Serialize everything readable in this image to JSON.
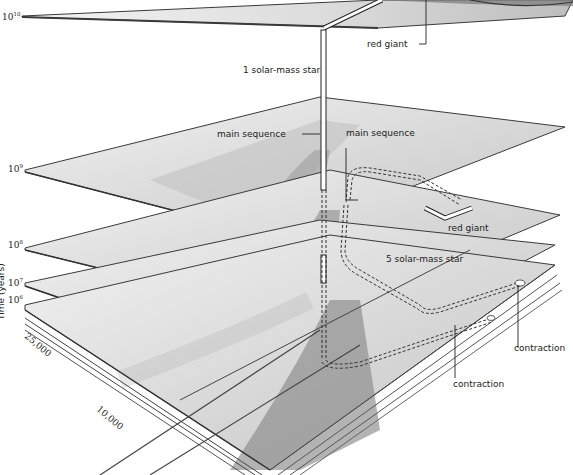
{
  "diagram": {
    "type": "3d-stacked-time-planes",
    "axis": {
      "vertical_label": "Time (years)",
      "time_ticks": [
        {
          "label": "10",
          "exp": "10"
        },
        {
          "label": "10",
          "exp": "9"
        },
        {
          "label": "10",
          "exp": "8"
        },
        {
          "label": "10",
          "exp": "7"
        },
        {
          "label": "10",
          "exp": "6"
        }
      ],
      "temperature_ticks": [
        "25,000",
        "10,000"
      ]
    },
    "labels": {
      "red_giant_top": "red giant",
      "one_solar_mass": "1 solar-mass star",
      "main_sequence_left": "main sequence",
      "main_sequence_right": "main sequence",
      "red_giant_mid": "red giant",
      "five_solar_mass": "5 solar-mass star",
      "contraction_right": "contraction",
      "contraction_lower": "contraction"
    },
    "colors": {
      "plate_light": "#ececec",
      "plate_mid": "#c8c8c8",
      "plate_dark": "#8a8a8a",
      "edge": "#3a3a3a",
      "text": "#222222"
    }
  }
}
